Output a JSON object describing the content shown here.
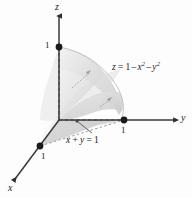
{
  "figure": {
    "background_color": "#fdfdfd",
    "axis_color": "#3a3a3a",
    "dot_color": "#1a1a1a",
    "surface_fill": "#d9d9d9",
    "surface_fill_light": "#ececec",
    "base_fill": "#cccccc"
  },
  "axes": {
    "z": {
      "label": "z"
    },
    "y": {
      "label": "y"
    },
    "x": {
      "label": "x"
    }
  },
  "ticks": {
    "z_one": "1",
    "y_one": "1",
    "x_one": "1"
  },
  "annotations": {
    "surface_equation": {
      "lhs": "z",
      "eq": "=",
      "rhs_one": "1",
      "minus_a": "–",
      "var_x": "x",
      "exp_x": "2",
      "minus_b": "–",
      "var_y": "y",
      "exp_y": "2",
      "plain": "z = 1 – x2 – y2"
    },
    "plane_equation": {
      "var_x": "x",
      "plus": "+",
      "var_y": "y",
      "eq": "=",
      "rhs": "1",
      "plain": "x + y = 1"
    }
  }
}
